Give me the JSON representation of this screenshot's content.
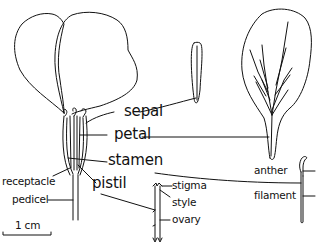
{
  "diagram": {
    "ink_color": "#111111",
    "background_color": "#ffffff",
    "main_labels": {
      "sepal": "sepal",
      "petal": "petal",
      "stamen": "stamen",
      "pistil": "pistil"
    },
    "flower_base_labels": {
      "receptacle": "receptacle",
      "pedicel": "pedicel"
    },
    "stamen_parts": {
      "anther": "anther",
      "filament": "filament"
    },
    "pistil_parts": {
      "stigma": "stigma",
      "style": "style",
      "ovary": "ovary"
    },
    "scale_bar": {
      "label": "1 cm"
    }
  }
}
